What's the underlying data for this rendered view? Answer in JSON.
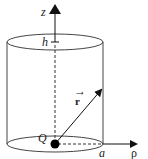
{
  "diagram": {
    "type": "cylinder-charge-geometry",
    "labels": {
      "z_axis": "z",
      "height": "h",
      "position_vector": "r",
      "position_vector_accent": "→",
      "charge": "Q",
      "radius": "a",
      "rho_axis": "ρ"
    },
    "colors": {
      "stroke": "#333333",
      "fill_point": "#000000",
      "background": "#ffffff"
    }
  }
}
